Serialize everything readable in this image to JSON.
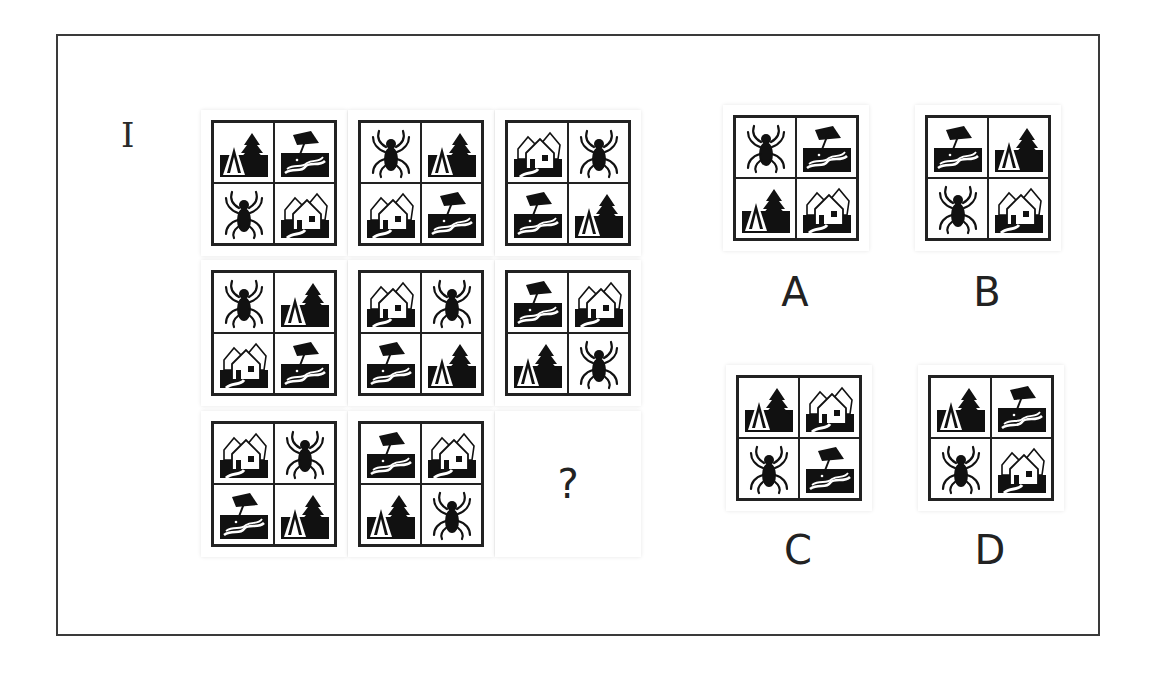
{
  "puzzle": {
    "label": "I",
    "question_mark": "?",
    "icon_types": [
      "camp-tent-tree",
      "beach-umbrella",
      "spider",
      "village-houses"
    ],
    "matrix": [
      {
        "row": 1,
        "col": 1,
        "cells": [
          "camp",
          "beach",
          "spider",
          "village"
        ]
      },
      {
        "row": 1,
        "col": 2,
        "cells": [
          "spider",
          "camp",
          "village",
          "beach"
        ]
      },
      {
        "row": 1,
        "col": 3,
        "cells": [
          "village",
          "spider",
          "beach",
          "camp"
        ]
      },
      {
        "row": 2,
        "col": 1,
        "cells": [
          "spider",
          "camp",
          "village",
          "beach"
        ]
      },
      {
        "row": 2,
        "col": 2,
        "cells": [
          "village",
          "spider",
          "beach",
          "camp"
        ]
      },
      {
        "row": 2,
        "col": 3,
        "cells": [
          "beach",
          "village",
          "camp",
          "spider"
        ]
      },
      {
        "row": 3,
        "col": 1,
        "cells": [
          "village",
          "spider",
          "beach",
          "camp"
        ]
      },
      {
        "row": 3,
        "col": 2,
        "cells": [
          "beach",
          "village",
          "camp",
          "spider"
        ]
      },
      {
        "row": 3,
        "col": 3,
        "cells": null
      }
    ],
    "options": [
      {
        "label": "A",
        "cells": [
          "spider",
          "beach",
          "camp",
          "village"
        ]
      },
      {
        "label": "B",
        "cells": [
          "beach",
          "camp",
          "spider",
          "village"
        ]
      },
      {
        "label": "C",
        "cells": [
          "camp",
          "village",
          "spider",
          "beach"
        ]
      },
      {
        "label": "D",
        "cells": [
          "camp",
          "beach",
          "spider",
          "village"
        ]
      }
    ]
  }
}
